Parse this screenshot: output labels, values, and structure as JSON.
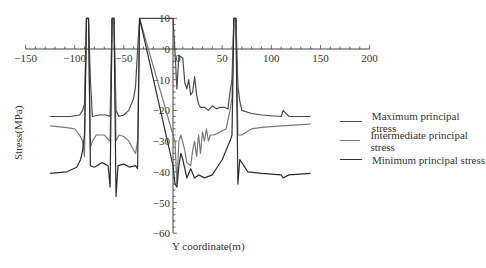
{
  "chart_data": {
    "type": "line",
    "title": "",
    "xlabel": "Y coordinate(m)",
    "ylabel": "Stress(MPa)",
    "xlim": [
      -150,
      200
    ],
    "ylim": [
      -60,
      10
    ],
    "x_ticks": [
      "-150",
      "-100",
      "-50",
      "0",
      "50",
      "100",
      "150",
      "200"
    ],
    "y_ticks": [
      "10",
      "0",
      "-10",
      "-20",
      "-30",
      "-40",
      "-50",
      "-60"
    ],
    "grid": false,
    "legend_position": "right",
    "series": [
      {
        "name": "Maximum principal stress",
        "color": "#4a4a4a",
        "points": [
          [
            -125,
            -22
          ],
          [
            -105,
            -22
          ],
          [
            -95,
            -21.5
          ],
          [
            -92,
            -20
          ],
          [
            -90,
            -18
          ],
          [
            -88,
            10
          ],
          [
            -86,
            10
          ],
          [
            -84,
            -10
          ],
          [
            -82,
            -22
          ],
          [
            -75,
            -21.5
          ],
          [
            -68,
            -21.5
          ],
          [
            -64,
            -22
          ],
          [
            -62,
            10
          ],
          [
            -60,
            10
          ],
          [
            -58,
            -20
          ],
          [
            -55,
            -22
          ],
          [
            -50,
            -21.5
          ],
          [
            -45,
            -20
          ],
          [
            -40,
            -16
          ],
          [
            -38,
            -12
          ],
          [
            -36,
            0
          ],
          [
            -34,
            10
          ],
          [
            0,
            10
          ],
          [
            2,
            -1
          ],
          [
            4,
            -13
          ],
          [
            6,
            -2
          ],
          [
            10,
            -3
          ],
          [
            12,
            -11
          ],
          [
            14,
            -13
          ],
          [
            16,
            -10
          ],
          [
            18,
            -15
          ],
          [
            20,
            -14
          ],
          [
            22,
            -9
          ],
          [
            24,
            -15
          ],
          [
            26,
            -18
          ],
          [
            28,
            -19
          ],
          [
            32,
            -19
          ],
          [
            36,
            -20
          ],
          [
            40,
            -18.5
          ],
          [
            44,
            -19.5
          ],
          [
            48,
            -19
          ],
          [
            52,
            -19
          ],
          [
            56,
            -19.5
          ],
          [
            58,
            -14
          ],
          [
            60,
            -10
          ],
          [
            62,
            10
          ],
          [
            64,
            10
          ],
          [
            66,
            -12
          ],
          [
            68,
            -17
          ],
          [
            70,
            -20
          ],
          [
            80,
            -21
          ],
          [
            90,
            -21.5
          ],
          [
            110,
            -22
          ],
          [
            112,
            -20
          ],
          [
            118,
            -22
          ],
          [
            140,
            -22
          ]
        ]
      },
      {
        "name": "Intermediate principal stress",
        "color": "#7a7a7a",
        "points": [
          [
            -125,
            -25
          ],
          [
            -110,
            -25.5
          ],
          [
            -100,
            -26
          ],
          [
            -95,
            -28
          ],
          [
            -92,
            -30
          ],
          [
            -90,
            -35
          ],
          [
            -88,
            10
          ],
          [
            -86,
            10
          ],
          [
            -84,
            -32
          ],
          [
            -82,
            -30
          ],
          [
            -78,
            -28
          ],
          [
            -70,
            -28
          ],
          [
            -64,
            -30
          ],
          [
            -62,
            10
          ],
          [
            -60,
            10
          ],
          [
            -58,
            -30
          ],
          [
            -55,
            -28
          ],
          [
            -50,
            -28.5
          ],
          [
            -45,
            -30
          ],
          [
            -40,
            -33
          ],
          [
            -38,
            -34
          ],
          [
            -36,
            -30
          ],
          [
            -34,
            10
          ],
          [
            0,
            -28
          ],
          [
            2,
            -30
          ],
          [
            4,
            -44
          ],
          [
            6,
            -30
          ],
          [
            8,
            -28
          ],
          [
            12,
            -33
          ],
          [
            14,
            -37
          ],
          [
            18,
            -38
          ],
          [
            20,
            -33
          ],
          [
            22,
            -30
          ],
          [
            24,
            -35
          ],
          [
            26,
            -28
          ],
          [
            28,
            -34
          ],
          [
            30,
            -27
          ],
          [
            32,
            -30
          ],
          [
            34,
            -26
          ],
          [
            36,
            -30
          ],
          [
            38,
            -28
          ],
          [
            42,
            -28
          ],
          [
            48,
            -27
          ],
          [
            54,
            -26
          ],
          [
            58,
            -20
          ],
          [
            60,
            -16
          ],
          [
            62,
            10
          ],
          [
            64,
            10
          ],
          [
            66,
            -28
          ],
          [
            70,
            -28
          ],
          [
            80,
            -26
          ],
          [
            90,
            -25.5
          ],
          [
            110,
            -25
          ],
          [
            140,
            -24.5
          ]
        ]
      },
      {
        "name": "Minimum principal stress",
        "color": "#2e2e2e",
        "points": [
          [
            -125,
            -40.5
          ],
          [
            -108,
            -40
          ],
          [
            -98,
            -38.5
          ],
          [
            -94,
            -36
          ],
          [
            -92,
            -33
          ],
          [
            -90,
            -28
          ],
          [
            -88,
            10
          ],
          [
            -86,
            10
          ],
          [
            -84,
            -38
          ],
          [
            -80,
            -38.5
          ],
          [
            -72,
            -37
          ],
          [
            -66,
            -38
          ],
          [
            -64,
            -45
          ],
          [
            -62,
            10
          ],
          [
            -60,
            10
          ],
          [
            -58,
            -48
          ],
          [
            -56,
            -38
          ],
          [
            -50,
            -37.5
          ],
          [
            -44,
            -38.5
          ],
          [
            -38,
            -38
          ],
          [
            -36,
            -39
          ],
          [
            -34,
            10
          ],
          [
            0,
            -38
          ],
          [
            2,
            -44
          ],
          [
            4,
            -45
          ],
          [
            6,
            -38
          ],
          [
            8,
            -34
          ],
          [
            10,
            -36
          ],
          [
            14,
            -42
          ],
          [
            18,
            -39
          ],
          [
            22,
            -42
          ],
          [
            26,
            -41
          ],
          [
            32,
            -42
          ],
          [
            40,
            -41
          ],
          [
            46,
            -38
          ],
          [
            50,
            -36
          ],
          [
            54,
            -33
          ],
          [
            58,
            -30
          ],
          [
            60,
            -28
          ],
          [
            62,
            10
          ],
          [
            64,
            10
          ],
          [
            66,
            -44
          ],
          [
            68,
            -36
          ],
          [
            72,
            -38
          ],
          [
            76,
            -40
          ],
          [
            90,
            -40.5
          ],
          [
            110,
            -41
          ],
          [
            112,
            -42
          ],
          [
            118,
            -41
          ],
          [
            140,
            -40.5
          ]
        ]
      }
    ]
  },
  "legend": {
    "items": [
      {
        "label": "Maximum principal stress"
      },
      {
        "label": "Intermediate principal stress"
      },
      {
        "label": "Minimum principal stress"
      }
    ]
  },
  "axes": {
    "xlabel": "Y coordinate(m)",
    "ylabel": "Stress(MPa)"
  }
}
